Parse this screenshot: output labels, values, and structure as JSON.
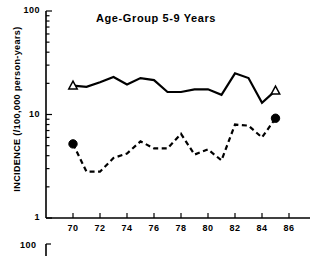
{
  "chart_data": {
    "type": "line",
    "title": "Age-Group 5-9 Years",
    "xlabel": "",
    "ylabel": "INCIDENCE (/100,000 person-years)",
    "yscale": "log",
    "ylim": [
      1,
      100
    ],
    "ytick_labels": [
      "100",
      "10",
      "1"
    ],
    "ytick_values": [
      100,
      10,
      1
    ],
    "xlim": [
      1969,
      1987
    ],
    "xtick_labels": [
      "70",
      "72",
      "74",
      "76",
      "78",
      "80",
      "82",
      "84",
      "86"
    ],
    "xtick_values": [
      70,
      72,
      74,
      76,
      78,
      80,
      82,
      84,
      86
    ],
    "grid": false,
    "legend": "none",
    "series": [
      {
        "name": "solid-line-series",
        "style": "solid",
        "marker": "open-triangle",
        "marker_points": [
          {
            "x": 70,
            "y": 19.0
          },
          {
            "x": 85,
            "y": 17.0
          }
        ],
        "x": [
          70,
          71,
          72,
          73,
          74,
          75,
          76,
          77,
          78,
          79,
          80,
          81,
          82,
          83,
          84,
          85
        ],
        "values": [
          19.0,
          18.5,
          20.5,
          23.0,
          19.5,
          22.5,
          21.5,
          16.5,
          16.5,
          17.5,
          17.5,
          15.5,
          25.0,
          22.5,
          13.0,
          17.0
        ]
      },
      {
        "name": "dashed-line-series",
        "style": "dashed",
        "marker": "filled-circle",
        "marker_points": [
          {
            "x": 70,
            "y": 5.2
          },
          {
            "x": 85,
            "y": 9.2
          }
        ],
        "x": [
          70,
          71,
          72,
          73,
          74,
          75,
          76,
          77,
          78,
          79,
          80,
          81,
          82,
          83,
          84,
          85
        ],
        "values": [
          5.2,
          2.8,
          2.8,
          3.8,
          4.2,
          5.5,
          4.7,
          4.7,
          6.5,
          4.1,
          4.6,
          3.6,
          8.0,
          7.8,
          6.0,
          9.2
        ]
      }
    ]
  },
  "axis": {
    "y_label": "INCIDENCE (/100,000 person-years)",
    "y_ticks": [
      {
        "label": "100"
      },
      {
        "label": "10"
      },
      {
        "label": "1"
      }
    ],
    "x_ticks": [
      {
        "label": "70"
      },
      {
        "label": "72"
      },
      {
        "label": "74"
      },
      {
        "label": "76"
      },
      {
        "label": "78"
      },
      {
        "label": "80"
      },
      {
        "label": "82"
      },
      {
        "label": "84"
      },
      {
        "label": "86"
      }
    ]
  },
  "title": "Age-Group 5-9 Years",
  "next_panel": {
    "ytick_label": "100"
  }
}
